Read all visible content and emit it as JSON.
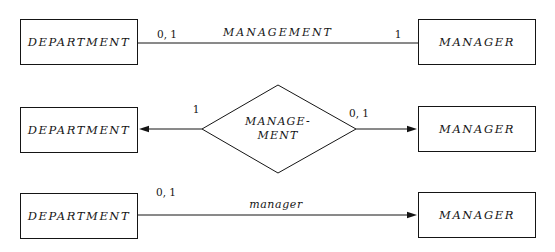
{
  "diagram": {
    "colors": {
      "ink": "#151515",
      "background": "#ffffff"
    },
    "rows": [
      {
        "style": "plain-line",
        "left_entity": "DEPARTMENT",
        "right_entity": "MANAGER",
        "labels": {
          "near_left": "0, 1",
          "center": "MANAGEMENT",
          "near_right": "1"
        }
      },
      {
        "style": "diamond-with-arrows-both-ends",
        "left_entity": "DEPARTMENT",
        "right_entity": "MANAGER",
        "relationship": {
          "shape": "diamond",
          "line1": "MANAGE-",
          "line2": "MENT"
        },
        "labels": {
          "near_left": "1",
          "near_right": "0, 1"
        }
      },
      {
        "style": "arrow-to-right-entity",
        "left_entity": "DEPARTMENT",
        "right_entity": "MANAGER",
        "labels": {
          "near_left": "0, 1",
          "center": "manager"
        }
      }
    ]
  }
}
